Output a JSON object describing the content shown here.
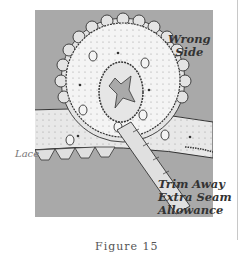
{
  "figure": {
    "labels": {
      "wrong_side_line1": "Wrong",
      "wrong_side_line2": "Side",
      "lace": "Lace",
      "trim_line1": "Trim Away",
      "trim_line2": "Extra Seam",
      "trim_line3": "Allowance"
    },
    "caption": "Figure 15",
    "colors": {
      "panel": "#a9a9a9",
      "fabric": "#f2f2f2",
      "scallop": "#e4e4e4",
      "ink": "#333333"
    }
  }
}
